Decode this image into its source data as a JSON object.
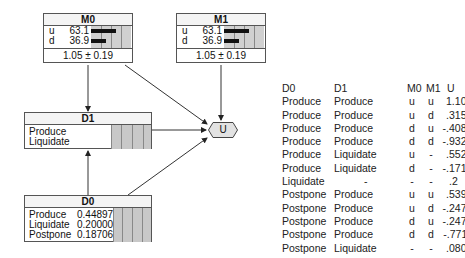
{
  "nodes": {
    "M0": {
      "title": "M0",
      "states": [
        {
          "label": "u",
          "value": "63.1",
          "pct": 63.1
        },
        {
          "label": "d",
          "value": "36.9",
          "pct": 36.9
        }
      ],
      "expected": "1.05 ± 0.19"
    },
    "M1": {
      "title": "M1",
      "states": [
        {
          "label": "u",
          "value": "63.1",
          "pct": 63.1
        },
        {
          "label": "d",
          "value": "36.9",
          "pct": 36.9
        }
      ],
      "expected": "1.05 ± 0.19"
    },
    "D1": {
      "title": "D1",
      "options": [
        "Produce",
        "Liquidate"
      ]
    },
    "D0": {
      "title": "D0",
      "options": [
        {
          "label": "Produce",
          "value": "0.44897"
        },
        {
          "label": "Liquidate",
          "value": "0.20000"
        },
        {
          "label": "Postpone",
          "value": "0.18706"
        }
      ]
    },
    "U": {
      "title": "U"
    }
  },
  "edges": [
    {
      "from": "M0",
      "to": "D1"
    },
    {
      "from": "M0",
      "to": "U"
    },
    {
      "from": "M1",
      "to": "U"
    },
    {
      "from": "D1",
      "to": "U"
    },
    {
      "from": "D0",
      "to": "D1"
    },
    {
      "from": "D0",
      "to": "U"
    }
  ],
  "utility_table": {
    "headers": [
      "D0",
      "D1",
      "M0",
      "M1",
      "U"
    ],
    "rows": [
      [
        "Produce",
        "Produce",
        "u",
        "u",
        "1.10166"
      ],
      [
        "Produce",
        "Produce",
        "u",
        "d",
        ".315436"
      ],
      [
        "Produce",
        "Produce",
        "d",
        "u",
        "-.408546"
      ],
      [
        "Produce",
        "Produce",
        "d",
        "d",
        "-.932696"
      ],
      [
        "Produce",
        "Liquidate",
        "u",
        "-",
        ".552941"
      ],
      [
        "Produce",
        "Liquidate",
        "d",
        "-",
        "-.171041"
      ],
      [
        "Liquidate",
        "-",
        "-",
        "-",
        ".2"
      ],
      [
        "Postpone",
        "Produce",
        "u",
        "u",
        ".539217"
      ],
      [
        "Postpone",
        "Produce",
        "u",
        "d",
        "-.247008"
      ],
      [
        "Postpone",
        "Produce",
        "d",
        "u",
        "-.247008"
      ],
      [
        "Postpone",
        "Produce",
        "d",
        "d",
        "-.771157"
      ],
      [
        "Postpone",
        "Liquidate",
        "-",
        "-",
        ".080996"
      ]
    ]
  }
}
